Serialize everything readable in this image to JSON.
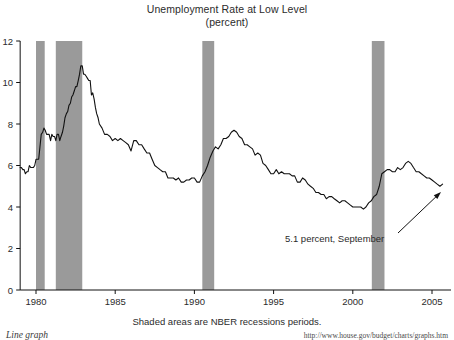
{
  "chart_data": {
    "type": "line",
    "title": "Unemployment Rate at Low Level",
    "subtitle": "(percent)",
    "xlabel": "",
    "ylabel": "",
    "ylim": [
      0,
      12
    ],
    "xlim": [
      1979.0,
      2006.2
    ],
    "yticks": [
      0,
      2,
      4,
      6,
      8,
      10,
      12
    ],
    "ytick_labels": [
      "0",
      "2",
      "4",
      "6",
      "8",
      "10",
      "12"
    ],
    "xticks": [
      1980,
      1985,
      1990,
      1995,
      2000,
      2005
    ],
    "xtick_labels": [
      "1980",
      "1985",
      "1990",
      "1995",
      "2000",
      "2005"
    ],
    "grid": false,
    "legend": "none",
    "line_color": "#111111",
    "shade_color": "#9a9a9a",
    "series": [
      {
        "name": "Unemployment Rate",
        "x": [
          1979.0,
          1979.08,
          1979.17,
          1979.25,
          1979.33,
          1979.42,
          1979.5,
          1979.58,
          1979.67,
          1979.75,
          1979.83,
          1979.92,
          1980.0,
          1980.08,
          1980.17,
          1980.25,
          1980.33,
          1980.42,
          1980.5,
          1980.58,
          1980.67,
          1980.75,
          1980.83,
          1980.92,
          1981.0,
          1981.08,
          1981.17,
          1981.25,
          1981.33,
          1981.42,
          1981.5,
          1981.58,
          1981.67,
          1981.75,
          1981.83,
          1981.92,
          1982.0,
          1982.08,
          1982.17,
          1982.25,
          1982.33,
          1982.42,
          1982.5,
          1982.58,
          1982.67,
          1982.75,
          1982.83,
          1982.92,
          1983.0,
          1983.08,
          1983.17,
          1983.25,
          1983.33,
          1983.42,
          1983.5,
          1983.58,
          1983.67,
          1983.75,
          1983.83,
          1983.92,
          1984.0,
          1984.17,
          1984.33,
          1984.5,
          1984.67,
          1984.83,
          1985.0,
          1985.17,
          1985.33,
          1985.5,
          1985.67,
          1985.83,
          1986.0,
          1986.17,
          1986.33,
          1986.5,
          1986.67,
          1986.83,
          1987.0,
          1987.17,
          1987.33,
          1987.5,
          1987.67,
          1987.83,
          1988.0,
          1988.17,
          1988.33,
          1988.5,
          1988.67,
          1988.83,
          1989.0,
          1989.17,
          1989.33,
          1989.5,
          1989.67,
          1989.83,
          1990.0,
          1990.17,
          1990.33,
          1990.5,
          1990.67,
          1990.83,
          1991.0,
          1991.17,
          1991.33,
          1991.5,
          1991.67,
          1991.83,
          1992.0,
          1992.17,
          1992.33,
          1992.5,
          1992.67,
          1992.83,
          1993.0,
          1993.17,
          1993.33,
          1993.5,
          1993.67,
          1993.83,
          1994.0,
          1994.17,
          1994.33,
          1994.5,
          1994.67,
          1994.83,
          1995.0,
          1995.17,
          1995.33,
          1995.5,
          1995.67,
          1995.83,
          1996.0,
          1996.17,
          1996.33,
          1996.5,
          1996.67,
          1996.83,
          1997.0,
          1997.17,
          1997.33,
          1997.5,
          1997.67,
          1997.83,
          1998.0,
          1998.17,
          1998.33,
          1998.5,
          1998.67,
          1998.83,
          1999.0,
          1999.17,
          1999.33,
          1999.5,
          1999.67,
          1999.83,
          2000.0,
          2000.17,
          2000.33,
          2000.5,
          2000.67,
          2000.83,
          2001.0,
          2001.17,
          2001.33,
          2001.5,
          2001.67,
          2001.83,
          2002.0,
          2002.17,
          2002.33,
          2002.5,
          2002.67,
          2002.83,
          2003.0,
          2003.17,
          2003.33,
          2003.5,
          2003.67,
          2003.83,
          2004.0,
          2004.17,
          2004.33,
          2004.5,
          2004.67,
          2004.83,
          2005.0,
          2005.17,
          2005.33,
          2005.5,
          2005.67
        ],
        "values": [
          5.9,
          5.9,
          5.8,
          5.8,
          5.6,
          5.7,
          5.7,
          6.0,
          5.9,
          5.9,
          5.9,
          6.0,
          6.3,
          6.3,
          6.3,
          6.9,
          7.5,
          7.6,
          7.8,
          7.7,
          7.5,
          7.5,
          7.5,
          7.2,
          7.5,
          7.4,
          7.4,
          7.2,
          7.5,
          7.5,
          7.2,
          7.4,
          7.6,
          7.9,
          8.3,
          8.5,
          8.6,
          8.9,
          9.0,
          9.3,
          9.4,
          9.6,
          9.8,
          9.8,
          10.1,
          10.4,
          10.8,
          10.8,
          10.4,
          10.4,
          10.3,
          10.2,
          10.1,
          10.1,
          9.4,
          9.5,
          9.2,
          8.8,
          8.5,
          8.3,
          8.0,
          7.8,
          7.5,
          7.5,
          7.4,
          7.2,
          7.3,
          7.2,
          7.3,
          7.2,
          7.1,
          7.0,
          6.7,
          7.2,
          7.2,
          7.0,
          7.0,
          6.8,
          6.6,
          6.6,
          6.3,
          6.0,
          5.9,
          5.8,
          5.7,
          5.7,
          5.4,
          5.4,
          5.4,
          5.3,
          5.4,
          5.2,
          5.2,
          5.3,
          5.3,
          5.4,
          5.4,
          5.2,
          5.2,
          5.5,
          5.7,
          6.0,
          6.4,
          6.7,
          6.9,
          6.8,
          7.0,
          7.3,
          7.3,
          7.4,
          7.6,
          7.7,
          7.6,
          7.4,
          7.3,
          7.0,
          7.0,
          6.9,
          6.8,
          6.5,
          6.6,
          6.5,
          6.1,
          6.0,
          5.8,
          5.6,
          5.6,
          5.8,
          5.6,
          5.7,
          5.6,
          5.6,
          5.6,
          5.5,
          5.5,
          5.2,
          5.2,
          5.4,
          5.3,
          5.1,
          5.0,
          4.9,
          4.7,
          4.7,
          4.6,
          4.6,
          4.4,
          4.5,
          4.5,
          4.4,
          4.3,
          4.2,
          4.3,
          4.3,
          4.2,
          4.1,
          4.0,
          4.0,
          4.0,
          4.0,
          3.9,
          4.0,
          4.2,
          4.3,
          4.5,
          4.6,
          5.0,
          5.6,
          5.7,
          5.8,
          5.8,
          5.7,
          5.7,
          5.9,
          5.8,
          5.9,
          6.1,
          6.2,
          6.1,
          5.9,
          5.7,
          5.7,
          5.6,
          5.5,
          5.4,
          5.4,
          5.3,
          5.2,
          5.1,
          5.0,
          5.1
        ]
      }
    ],
    "shaded_regions": [
      {
        "label": "NBER recession",
        "start": 1980.0,
        "end": 1980.55
      },
      {
        "label": "NBER recession",
        "start": 1981.25,
        "end": 1982.92
      },
      {
        "label": "NBER recession",
        "start": 1990.5,
        "end": 1991.25
      },
      {
        "label": "NBER recession",
        "start": 2001.2,
        "end": 2002.0
      }
    ],
    "annotations": [
      {
        "text": "5.1 percent, September",
        "text_x": 285,
        "text_y": 242,
        "arrow_from_x": 398,
        "arrow_from_y": 233,
        "arrow_to_x": 441,
        "arrow_to_y": 192
      }
    ],
    "caption": "Shaded areas are NBER recessions periods."
  },
  "footer": {
    "left": "Line graph",
    "right": "http://www.house.gov/budget/charts/graphs.htm"
  }
}
